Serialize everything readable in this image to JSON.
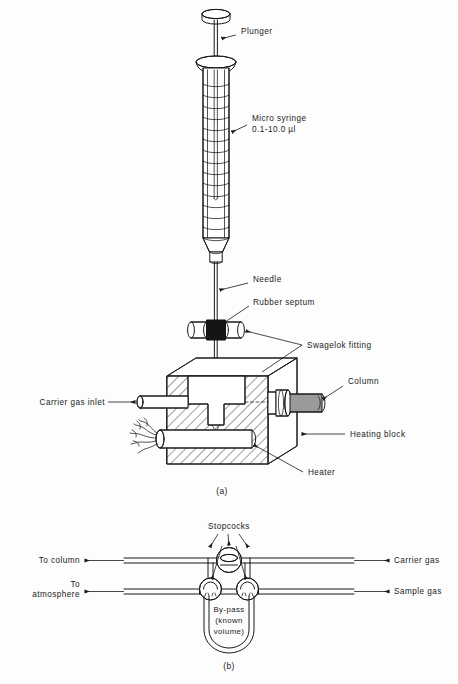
{
  "figure": {
    "panels": [
      {
        "id": "a",
        "caption": "(a)",
        "description": "Micro syringe injection through rubber septum into heated injector block",
        "labels": {
          "plunger": "Plunger",
          "syringe_line1": "Micro syringe",
          "syringe_line2": "0.1-10.0 µl",
          "needle": "Needle",
          "septum": "Rubber septum",
          "swagelok": "Swagelok fitting",
          "column": "Column",
          "heating_block": "Heating block",
          "heater": "Heater",
          "carrier_inlet": "Carrier gas inlet"
        }
      },
      {
        "id": "b",
        "caption": "(b)",
        "description": "Gas sampling valve with by-pass loop of known volume",
        "labels": {
          "stopcocks": "Stopcocks",
          "to_column": "To column",
          "to_atmosphere_line1": "To",
          "to_atmosphere_line2": "atmosphere",
          "carrier_gas": "Carrier gas",
          "sample_gas": "Sample gas",
          "bypass_line1": "By-pass",
          "bypass_line2": "(known",
          "bypass_line3": "volume)"
        }
      }
    ]
  },
  "colors": {
    "ink": "#1a1a1a",
    "paper": "#fdfdfd",
    "septum_fill": "#141414",
    "column_packing": "#9a9a9a",
    "hatch": "#1a1a1a"
  }
}
